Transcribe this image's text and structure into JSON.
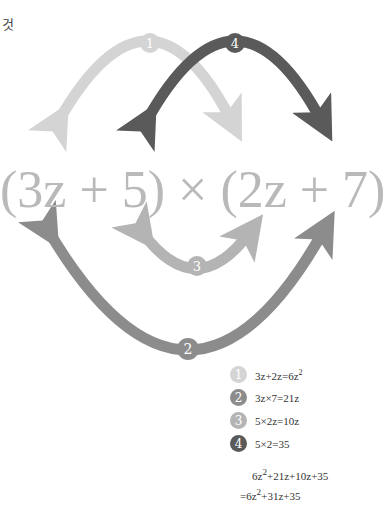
{
  "corner_label": "것",
  "expression": {
    "left_factor": "(3z + 5)",
    "times": "×",
    "right_factor": "(2z + 7)"
  },
  "arrows": [
    {
      "number": "1",
      "from": "3z",
      "to": "2z",
      "color": "#d4d4d4"
    },
    {
      "number": "2",
      "from": "3z",
      "to": "7",
      "color": "#8c8c8c"
    },
    {
      "number": "3",
      "from": "5",
      "to": "2z",
      "color": "#b4b4b4"
    },
    {
      "number": "4",
      "from": "5",
      "to": "7",
      "color": "#5a5a5a"
    }
  ],
  "legend": [
    {
      "number": "1",
      "text": "3z+2z=6z",
      "sup": "2",
      "color": "#d4d4d4"
    },
    {
      "number": "2",
      "text": "3z×7=21z",
      "sup": "",
      "color": "#8c8c8c"
    },
    {
      "number": "3",
      "text": "5×2z=10z",
      "sup": "",
      "color": "#b4b4b4"
    },
    {
      "number": "4",
      "text": "5×2=35",
      "sup": "",
      "color": "#5a5a5a"
    }
  ],
  "result": {
    "line1_a": "6z",
    "line1_sup": "2",
    "line1_b": "+21z+10z+35",
    "line2_a": "=6z",
    "line2_sup": "2",
    "line2_b": "+31z+35"
  }
}
